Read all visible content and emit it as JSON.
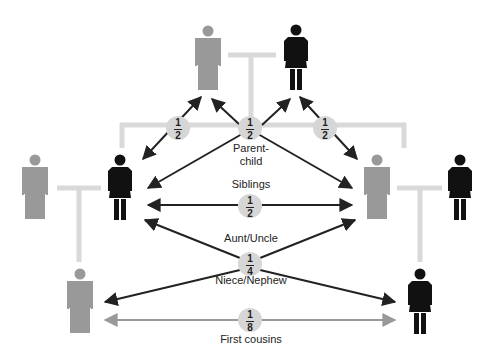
{
  "diagram": {
    "colors": {
      "male": "#999999",
      "female": "#111111",
      "connector": "#d9d9d9",
      "arrow_primary": "#222222",
      "arrow_cousin": "#999999",
      "badge": "#d6d6d6"
    },
    "people": [
      {
        "id": "grandfather",
        "sex": "male",
        "icon": "male-figure-icon"
      },
      {
        "id": "grandmother",
        "sex": "female",
        "icon": "female-figure-icon"
      },
      {
        "id": "left-parent-female",
        "sex": "female",
        "icon": "female-figure-icon"
      },
      {
        "id": "left-spouse-male",
        "sex": "male",
        "icon": "male-figure-icon"
      },
      {
        "id": "right-parent-male",
        "sex": "male",
        "icon": "male-figure-icon"
      },
      {
        "id": "right-spouse-female",
        "sex": "female",
        "icon": "female-figure-icon"
      },
      {
        "id": "left-child-male",
        "sex": "male",
        "icon": "male-figure-icon"
      },
      {
        "id": "right-child-female",
        "sex": "female",
        "icon": "female-figure-icon"
      }
    ],
    "relationships": [
      {
        "label": "Parent-\nchild",
        "label_line1": "Parent-",
        "label_line2": "child",
        "numerator": "1",
        "denominator": "2"
      },
      {
        "label": "Siblings",
        "numerator": "1",
        "denominator": "2"
      },
      {
        "label": "Aunt/Uncle",
        "numerator": "1",
        "denominator": "4"
      },
      {
        "label": "Niece/Nephew"
      },
      {
        "label": "First cousins",
        "numerator": "1",
        "denominator": "8"
      }
    ],
    "side_badges": [
      {
        "numerator": "1",
        "denominator": "2"
      },
      {
        "numerator": "1",
        "denominator": "2"
      }
    ]
  }
}
